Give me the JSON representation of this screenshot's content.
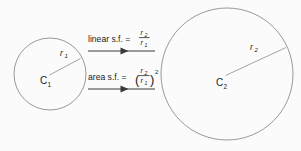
{
  "diagram": {
    "background_color": "#fbfbfb",
    "stroke_color": "#8d8d93",
    "text_color": "#1c1c1c",
    "arrow_color": "#3a3a3a",
    "small_circle": {
      "name": "circle-small",
      "center_label": "C",
      "center_subscript": "1",
      "radius_label": "r",
      "radius_subscript": "1",
      "cx": 50,
      "cy": 74,
      "r": 36
    },
    "large_circle": {
      "name": "circle-large",
      "center_label": "C",
      "center_subscript": "2",
      "radius_label": "r",
      "radius_subscript": "2",
      "cx": 227,
      "cy": 74,
      "r": 66
    },
    "relations": [
      {
        "id": "linear-scale-factor",
        "label": "linear s.f.  =",
        "equals": "=",
        "numerator": "r",
        "numerator_sub": "2",
        "denominator": "r",
        "denominator_sub": "1",
        "exponent": "",
        "parenthesized": false,
        "full_text": "linear s.f. = r2 / r1"
      },
      {
        "id": "area-scale-factor",
        "label": "area s.f.  =",
        "equals": "=",
        "numerator": "r",
        "numerator_sub": "2",
        "denominator": "r",
        "denominator_sub": "1",
        "exponent": "2",
        "parenthesized": true,
        "full_text": "area s.f. = (r2 / r1)^2"
      }
    ],
    "arrows": [
      {
        "id": "arrow-linear",
        "direction": "right",
        "x_start": 88,
        "x_end": 155,
        "y": 51
      },
      {
        "id": "arrow-area",
        "direction": "right",
        "x_start": 88,
        "x_end": 155,
        "y": 89
      }
    ]
  }
}
